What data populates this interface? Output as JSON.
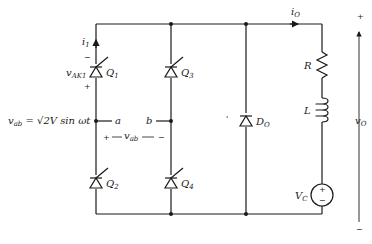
{
  "diagram": {
    "type": "single-phase full-bridge thyristor rectifier with freewheeling diode",
    "source_equation": "v_ab = √2V sin ωt",
    "source_label_parts": {
      "var": "v",
      "sub": "ab",
      "eq": " = √2V sin ωt"
    },
    "nodes": {
      "a": "a",
      "b": "b"
    },
    "vab_label": {
      "plus": "+",
      "var": "v",
      "sub": "ab",
      "minus": "−"
    },
    "thyristors": [
      {
        "id": "Q1",
        "var": "Q",
        "sub": "1"
      },
      {
        "id": "Q2",
        "var": "Q",
        "sub": "2"
      },
      {
        "id": "Q3",
        "var": "Q",
        "sub": "3"
      },
      {
        "id": "Q4",
        "var": "Q",
        "sub": "4"
      }
    ],
    "i1": {
      "var": "i",
      "sub": "1"
    },
    "vak1": {
      "var": "v",
      "sub": "AK1",
      "minus": "−",
      "plus": "+"
    },
    "diode": {
      "var": "D",
      "sub": "O"
    },
    "current_out": {
      "var": "i",
      "sub": "O"
    },
    "resistor": "R",
    "inductor": "L",
    "source_vc": {
      "var": "V",
      "sub": "C",
      "plus": "+",
      "minus": "−"
    },
    "output_voltage": {
      "var": "v",
      "sub": "O",
      "plus": "+",
      "minus": "−"
    },
    "stray_mark": "'"
  }
}
